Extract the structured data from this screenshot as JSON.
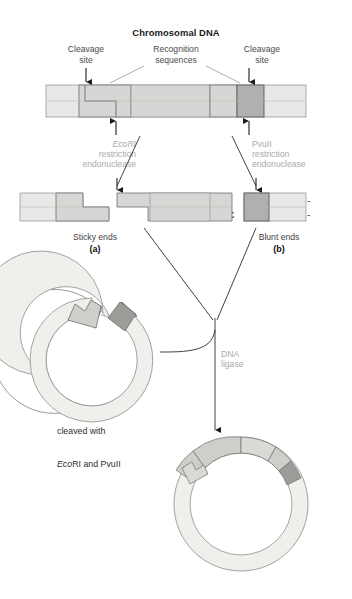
{
  "figure": {
    "title": "Chromosomal DNA",
    "domain": "molecular-biology-diagram"
  },
  "top_labels": {
    "cleavage_left": "Cleavage\nsite",
    "recognition": "Recognition\nsequences",
    "cleavage_right": "Cleavage\nsite"
  },
  "chromosomal_dna": {
    "top_strand": {
      "flank_left": "---GGT",
      "ecori_first": "G",
      "ecori_rest": "AATTC",
      "spacer": "AGC...TAG",
      "pvuii_left": "CAG",
      "pvuii_right": "CTG",
      "flank_right": "TAGC---",
      "full": "---GGTGAATTCAGC...TAGCAGCTGTAGC---"
    },
    "bottom_strand": {
      "flank_left": "---CCA",
      "ecori_rest": "CTTAA",
      "ecori_last": "G",
      "spacer": "TCG...ATC",
      "pvuii_left": "GTC",
      "pvuii_right": "GAC",
      "flank_right": "ATCG---",
      "full": "---CCACTTAAGTCG...ATCGTCGACATCG---"
    }
  },
  "enzymes": {
    "left": {
      "name": "EcoRI",
      "line2": "restriction",
      "line3": "endonuclease"
    },
    "right": {
      "name": "PvuII",
      "line2": "restriction",
      "line3": "endonuclease"
    }
  },
  "fragments": {
    "left": {
      "top": "---GGTG",
      "bottom": "---CCACTTAA"
    },
    "middle": {
      "top_overhang": "AATTC",
      "top_rest": "AGC...TAG",
      "top_pvuii": "CAG",
      "bottom": "GTCG...ATC",
      "bottom_pvuii": "GTC",
      "top_full": "AATTCAGC...TAGCAG",
      "bottom_full": "GTCG...ATCGTC"
    },
    "right": {
      "top_pvuii": "CTG",
      "top_rest": "TAGC---",
      "bottom_pvuii": "GAC",
      "bottom_rest": "ATCG---",
      "top_full": "CTGTAGC---",
      "bottom_full": "GACATCG---"
    }
  },
  "captions": {
    "sticky": "Sticky ends",
    "sticky_letter": "(a)",
    "blunt": "Blunt ends",
    "blunt_letter": "(b)"
  },
  "plasmid": {
    "text_line1": "Plasmid",
    "text_line2": "cloning vector",
    "text_line3": "cleaved with",
    "text_line4_italic": "Eco",
    "text_line4_rest": "RI and PvuII"
  },
  "ligase": {
    "line1": "DNA",
    "line2": "ligase"
  },
  "colors": {
    "backbone_light": "#e8e8e6",
    "recognition_mid": "#d2d2d0",
    "pvuii_dark": "#b0b0ae",
    "stroke": "#6e6e6e",
    "text": "#141414",
    "gray_label": "#a9a9a9",
    "plasmid_fill": "#efefeb",
    "plasmid_sticky": "#cfcfca",
    "plasmid_blunt": "#9c9c98"
  }
}
